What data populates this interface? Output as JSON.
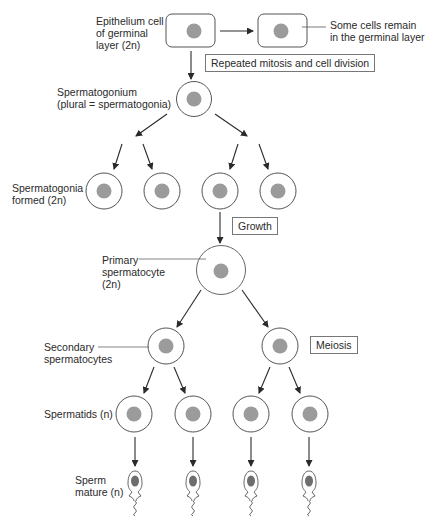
{
  "colors": {
    "stroke": "#555555",
    "arrow": "#2a2a2a",
    "nucleus": "#9b9b9b",
    "sperm_nucleus": "#6e6e6e",
    "cell_fill": "#ffffff"
  },
  "labels": {
    "epithelium": "Epithelium cell\nof germinal\nlayer (2n)",
    "remain": "Some cells remain\nin the germinal layer",
    "spermatogonium": "Spermatogonium\n(plural = spermatogonia)",
    "spermatogonia_formed": "Spermatogonia\nformed (2n)",
    "primary": "Primary\nspermatocyte\n(2n)",
    "secondary": "Secondary\nspermatocytes",
    "spermatids": "Spermatids (n)",
    "sperm": "Sperm\nmature (n)"
  },
  "boxes": {
    "mitosis": "Repeated mitosis and cell division",
    "growth": "Growth",
    "meiosis": "Meiosis"
  },
  "stages": [
    {
      "name": "epithelium",
      "count": 2,
      "ploidy": "2n"
    },
    {
      "name": "spermatogonium",
      "count": 1,
      "ploidy": "2n"
    },
    {
      "name": "spermatogonia",
      "count": 4,
      "ploidy": "2n"
    },
    {
      "name": "primary spermatocyte",
      "count": 1,
      "ploidy": "2n"
    },
    {
      "name": "secondary spermatocytes",
      "count": 2
    },
    {
      "name": "spermatids",
      "count": 4,
      "ploidy": "n"
    },
    {
      "name": "sperm",
      "count": 4,
      "ploidy": "n"
    }
  ]
}
